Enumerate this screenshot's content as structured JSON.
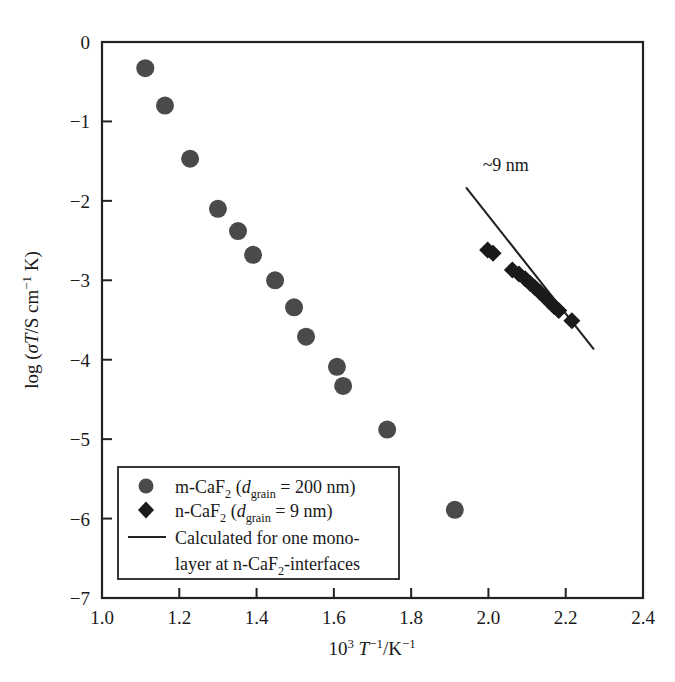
{
  "chart_data": {
    "type": "scatter",
    "title": "",
    "xlabel": "10^3 T^-1/K^-1",
    "ylabel": "log (sigmaT/S cm^-1 K)",
    "xlim": [
      1.0,
      2.4
    ],
    "ylim": [
      -7,
      0
    ],
    "xticks": [
      "1.0",
      "1.2",
      "1.4",
      "1.6",
      "1.8",
      "2.0",
      "2.2",
      "2.4"
    ],
    "xtick_values": [
      1.0,
      1.2,
      1.4,
      1.6,
      1.8,
      2.0,
      2.2,
      2.4
    ],
    "yticks": [
      "0",
      "−1",
      "−2",
      "−3",
      "−4",
      "−5",
      "−6",
      "−7"
    ],
    "ytick_values": [
      0,
      -1,
      -2,
      -3,
      -4,
      -5,
      -6,
      -7
    ],
    "grid": false,
    "legend_position": "lower-left-inside",
    "marker_color": "#4a4a4a",
    "diamond_color": "#1a1a1a",
    "line_color": "#222222",
    "axis_color": "#222222",
    "series": [
      {
        "name": "m-CaF2 (d_grain = 200 nm)",
        "marker": "circle",
        "color": "#4a4a4a",
        "points": [
          {
            "x": 1.112,
            "y": -0.33
          },
          {
            "x": 1.163,
            "y": -0.8
          },
          {
            "x": 1.228,
            "y": -1.47
          },
          {
            "x": 1.3,
            "y": -2.1
          },
          {
            "x": 1.352,
            "y": -2.38
          },
          {
            "x": 1.391,
            "y": -2.68
          },
          {
            "x": 1.448,
            "y": -3.0
          },
          {
            "x": 1.497,
            "y": -3.34
          },
          {
            "x": 1.528,
            "y": -3.71
          },
          {
            "x": 1.608,
            "y": -4.09
          },
          {
            "x": 1.624,
            "y": -4.33
          },
          {
            "x": 1.738,
            "y": -4.88
          },
          {
            "x": 1.913,
            "y": -5.89
          }
        ]
      },
      {
        "name": "n-CaF2 (d_grain = 9 nm)",
        "marker": "diamond",
        "color": "#1a1a1a",
        "points": [
          {
            "x": 1.998,
            "y": -2.62
          },
          {
            "x": 2.012,
            "y": -2.66
          },
          {
            "x": 2.062,
            "y": -2.87
          },
          {
            "x": 2.079,
            "y": -2.92
          },
          {
            "x": 2.095,
            "y": -2.98
          },
          {
            "x": 2.108,
            "y": -3.04
          },
          {
            "x": 2.12,
            "y": -3.09
          },
          {
            "x": 2.133,
            "y": -3.15
          },
          {
            "x": 2.146,
            "y": -3.21
          },
          {
            "x": 2.158,
            "y": -3.27
          },
          {
            "x": 2.17,
            "y": -3.33
          },
          {
            "x": 2.182,
            "y": -3.38
          },
          {
            "x": 2.216,
            "y": -3.51
          }
        ]
      }
    ],
    "lines": [
      {
        "name": "Calculated for one monolayer at n-CaF2-interfaces",
        "x_start": 1.942,
        "y_start": -1.83,
        "x_end": 2.273,
        "y_end": -3.87,
        "color": "#222222"
      }
    ],
    "annotations": [
      {
        "text": "~9 nm",
        "x": 1.985,
        "y": -1.62
      }
    ]
  },
  "axes": {
    "x_title_parts": {
      "base": "10",
      "exp": "3",
      "var": "T",
      "var_exp": "−1",
      "slash_unit": "/K",
      "unit_exp": "−1"
    },
    "y_title_parts": {
      "log": "log (",
      "sigma": "σ",
      "T": "T",
      "slash": "/S cm",
      "exp": "−1",
      "k": " K)"
    }
  },
  "legend": {
    "items": [
      {
        "marker": "circle",
        "label_pre": "m-CaF",
        "label_sub": "2",
        "label_mid": " (",
        "label_ital": "d",
        "label_ital_sub": "grain",
        "label_post": " = 200 nm)"
      },
      {
        "marker": "diamond",
        "label_pre": "n-CaF",
        "label_sub": "2",
        "label_mid": " (",
        "label_ital": "d",
        "label_ital_sub": "grain",
        "label_post": " = 9 nm)"
      },
      {
        "marker": "line",
        "line1": "Calculated for one mono-",
        "line2_pre": "layer at n-CaF",
        "line2_sub": "2",
        "line2_post": "-interfaces"
      }
    ]
  },
  "annotation_label": "~9 nm"
}
